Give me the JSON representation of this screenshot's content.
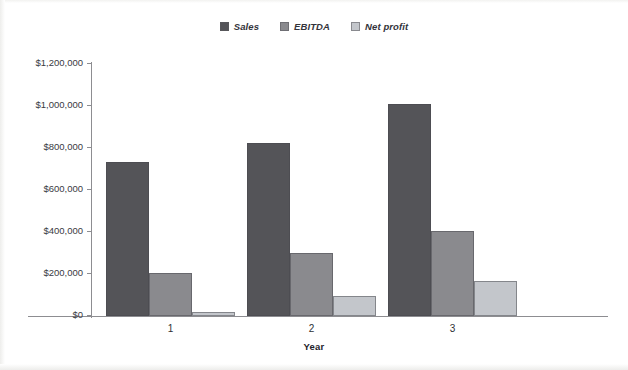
{
  "chart_data": {
    "type": "bar",
    "title": "",
    "xlabel": "Year",
    "ylabel": "",
    "categories": [
      "1",
      "2",
      "3"
    ],
    "series": [
      {
        "name": "Sales",
        "color": "#545458",
        "values": [
          735000,
          825000,
          1010000
        ]
      },
      {
        "name": "EBITDA",
        "color": "#8a8a8e",
        "values": [
          205000,
          300000,
          405000
        ]
      },
      {
        "name": "Net profit",
        "color": "#c3c6cb",
        "values": [
          20000,
          97000,
          167000
        ]
      }
    ],
    "ylim": [
      0,
      1200000
    ],
    "ytick_values": [
      0,
      200000,
      400000,
      600000,
      800000,
      1000000,
      1200000
    ],
    "ytick_labels": [
      "$0",
      "$200,000",
      "$400,000",
      "$600,000",
      "$800,000",
      "$1,000,000",
      "$1,200,000"
    ],
    "grid": false,
    "legend_position": "top-center"
  }
}
